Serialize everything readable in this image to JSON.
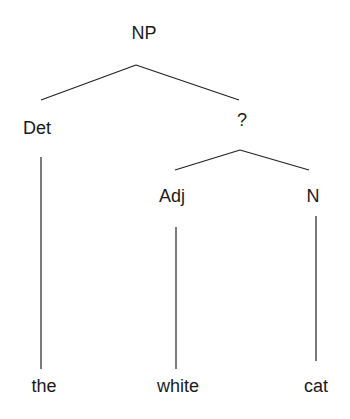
{
  "tree": {
    "root": "NP",
    "nodes": {
      "np": {
        "label": "NP"
      },
      "det": {
        "label": "Det"
      },
      "unknown": {
        "label": "?"
      },
      "adj": {
        "label": "Adj"
      },
      "n": {
        "label": "N"
      },
      "the": {
        "label": "the"
      },
      "white": {
        "label": "white"
      },
      "cat": {
        "label": "cat"
      }
    },
    "edges": [
      [
        "NP",
        "Det"
      ],
      [
        "NP",
        "?"
      ],
      [
        "?",
        "Adj"
      ],
      [
        "?",
        "N"
      ],
      [
        "Det",
        "the"
      ],
      [
        "Adj",
        "white"
      ],
      [
        "N",
        "cat"
      ]
    ],
    "line_color": "#222222"
  }
}
